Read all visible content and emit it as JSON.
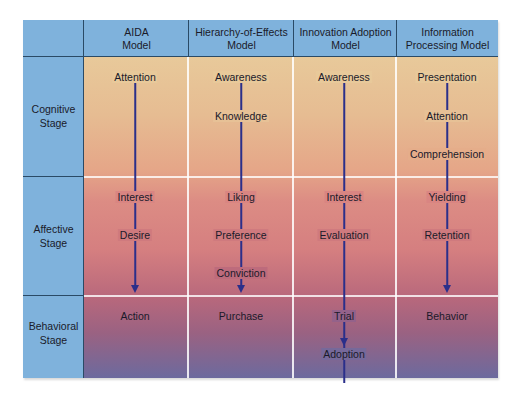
{
  "header": {
    "columns": [
      {
        "title": "AIDA Model",
        "line1": "AIDA",
        "line2": "Model"
      },
      {
        "title": "Hierarchy-of-Effects Model",
        "line1": "Hierarchy-of-Effects",
        "line2": "Model"
      },
      {
        "title": "Innovation Adoption Model",
        "line1": "Innovation Adoption",
        "line2": "Model"
      },
      {
        "title": "Information Processing Model",
        "line1": "Information",
        "line2": "Processing Model"
      }
    ]
  },
  "stages": [
    {
      "line1": "Cognitive",
      "line2": "Stage"
    },
    {
      "line1": "Affective",
      "line2": "Stage"
    },
    {
      "line1": "Behavioral",
      "line2": "Stage"
    }
  ],
  "models": {
    "aida": [
      "Attention",
      "Interest",
      "Desire",
      "Action"
    ],
    "hierarchy_of_effects": [
      "Awareness",
      "Knowledge",
      "Liking",
      "Preference",
      "Conviction",
      "Purchase"
    ],
    "innovation_adoption": [
      "Awareness",
      "Interest",
      "Evaluation",
      "Trial",
      "Adoption"
    ],
    "information_processing": [
      "Presentation",
      "Attention",
      "Comprehension",
      "Yielding",
      "Retention",
      "Behavior"
    ]
  },
  "colors": {
    "header_blue": "#7fb2dc",
    "arrow_blue": "#2b2f8a",
    "divider_dark": "#2a4a66",
    "gradient_top": "#e8c99a",
    "gradient_mid": "#d57f80",
    "gradient_bottom": "#6c6a9e"
  }
}
